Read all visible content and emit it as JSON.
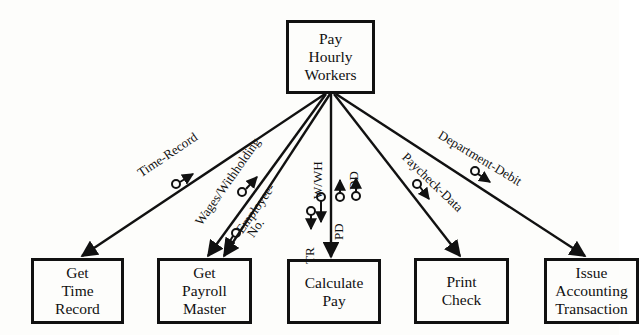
{
  "diagram": {
    "type": "structure-chart",
    "root": {
      "lines": [
        "Pay",
        "Hourly",
        "Workers"
      ]
    },
    "modules": [
      {
        "id": "get-time-record",
        "lines": [
          "Get",
          "Time",
          "Record"
        ]
      },
      {
        "id": "get-payroll-master",
        "lines": [
          "Get",
          "Payroll",
          "Master"
        ]
      },
      {
        "id": "calculate-pay",
        "lines": [
          "Calculate",
          "Pay"
        ]
      },
      {
        "id": "print-check",
        "lines": [
          "Print",
          "Check"
        ]
      },
      {
        "id": "issue-accounting-transaction",
        "lines": [
          "Issue",
          "Accounting",
          "Transaction"
        ]
      }
    ],
    "couples": {
      "time_record": "Time-Record",
      "wages_withholding": "Wages/Withholding",
      "employee_no_line1": "Employee-",
      "employee_no_line2": "No.",
      "tr": "TR",
      "wwh": "W/WH",
      "pd": "PD",
      "dd": "DD",
      "paycheck_data": "Paycheck-Data",
      "department_debit": "Department-Debit"
    },
    "colors": {
      "ink": "#111111",
      "paper": "#fdfdfb"
    }
  }
}
